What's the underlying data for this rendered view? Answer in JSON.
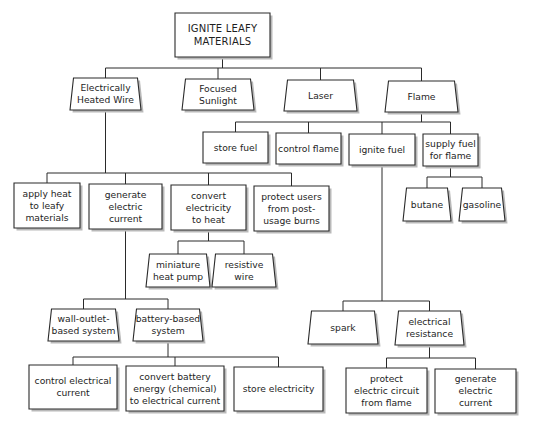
{
  "diagram": {
    "title": "IGNITE LEAFY MATERIALS",
    "nodes": [
      {
        "id": "root",
        "label": "IGNITE LEAFY\nMATERIALS",
        "shape": "rect",
        "x": 175,
        "y": 13,
        "w": 95,
        "h": 44
      },
      {
        "id": "electrically-heated-wire",
        "label": "Electrically\nHeated Wire",
        "shape": "trap",
        "x": 70,
        "y": 78,
        "w": 71,
        "h": 32
      },
      {
        "id": "focused-sunlight",
        "label": "Focused\nSunlight",
        "shape": "trap",
        "x": 182,
        "y": 79,
        "w": 72,
        "h": 31
      },
      {
        "id": "laser",
        "label": "Laser",
        "shape": "trap",
        "x": 284,
        "y": 80,
        "w": 73,
        "h": 31
      },
      {
        "id": "flame",
        "label": "Flame",
        "shape": "trap",
        "x": 385,
        "y": 81,
        "w": 73,
        "h": 31
      },
      {
        "id": "store-fuel",
        "label": "store fuel",
        "shape": "rect",
        "x": 203,
        "y": 132,
        "w": 65,
        "h": 31
      },
      {
        "id": "control-flame",
        "label": "control flame",
        "shape": "rect",
        "x": 276,
        "y": 133,
        "w": 65,
        "h": 31
      },
      {
        "id": "ignite-fuel",
        "label": "ignite fuel",
        "shape": "rect",
        "x": 349,
        "y": 134,
        "w": 66,
        "h": 31
      },
      {
        "id": "supply-fuel",
        "label": "supply fuel\nfor flame",
        "shape": "rect",
        "x": 423,
        "y": 134,
        "w": 55,
        "h": 32
      },
      {
        "id": "apply-heat",
        "label": "apply heat\nto leafy\nmaterials",
        "shape": "rect",
        "x": 14,
        "y": 183,
        "w": 66,
        "h": 45
      },
      {
        "id": "generate-electric-current",
        "label": "generate\nelectric\ncurrent",
        "shape": "rect",
        "x": 89,
        "y": 184,
        "w": 73,
        "h": 45
      },
      {
        "id": "convert-electricity",
        "label": "convert\nelectricity\nto heat",
        "shape": "rect",
        "x": 171,
        "y": 185,
        "w": 75,
        "h": 45
      },
      {
        "id": "protect-users",
        "label": "protect users\nfrom post-\nusage burns",
        "shape": "rect",
        "x": 254,
        "y": 186,
        "w": 75,
        "h": 45
      },
      {
        "id": "butane",
        "label": "butane",
        "shape": "trap",
        "x": 403,
        "y": 188,
        "w": 48,
        "h": 33
      },
      {
        "id": "gasoline",
        "label": "gasoline",
        "shape": "trap",
        "x": 459,
        "y": 188,
        "w": 46,
        "h": 33
      },
      {
        "id": "miniature-heat-pump",
        "label": "miniature\nheat pump",
        "shape": "trap",
        "x": 146,
        "y": 254,
        "w": 64,
        "h": 33
      },
      {
        "id": "resistive-wire",
        "label": "resistive\nwire",
        "shape": "trap",
        "x": 212,
        "y": 254,
        "w": 64,
        "h": 33
      },
      {
        "id": "wall-outlet",
        "label": "wall-outlet-\nbased system",
        "shape": "trap",
        "x": 48,
        "y": 309,
        "w": 71,
        "h": 32
      },
      {
        "id": "battery-based",
        "label": "battery-based\nsystem",
        "shape": "trap",
        "x": 133,
        "y": 309,
        "w": 70,
        "h": 32
      },
      {
        "id": "control-electrical-current",
        "label": "control electrical\ncurrent",
        "shape": "rect",
        "x": 29,
        "y": 365,
        "w": 88,
        "h": 44
      },
      {
        "id": "convert-battery",
        "label": "convert battery\nenergy (chemical)\nto electrical current",
        "shape": "rect",
        "x": 126,
        "y": 366,
        "w": 98,
        "h": 45
      },
      {
        "id": "store-electricity",
        "label": "store electricity",
        "shape": "rect",
        "x": 234,
        "y": 367,
        "w": 89,
        "h": 44
      },
      {
        "id": "spark",
        "label": "spark",
        "shape": "trap",
        "x": 308,
        "y": 311,
        "w": 70,
        "h": 33
      },
      {
        "id": "electrical-resistance",
        "label": "electrical\nresistance",
        "shape": "trap",
        "x": 395,
        "y": 311,
        "w": 69,
        "h": 34
      },
      {
        "id": "protect-electric-circuit",
        "label": "protect\nelectric circuit\nfrom flame",
        "shape": "rect",
        "x": 346,
        "y": 368,
        "w": 81,
        "h": 45
      },
      {
        "id": "generate-electric-current-2",
        "label": "generate\nelectric\ncurrent",
        "shape": "rect",
        "x": 435,
        "y": 369,
        "w": 81,
        "h": 44
      }
    ],
    "edges": [
      {
        "parent": "root",
        "children": [
          "electrically-heated-wire",
          "focused-sunlight",
          "laser",
          "flame"
        ],
        "barY": 68
      },
      {
        "parent": "flame",
        "children": [
          "store-fuel",
          "control-flame",
          "ignite-fuel",
          "supply-fuel"
        ],
        "barY": 122
      },
      {
        "parent": "electrically-heated-wire",
        "children": [
          "apply-heat",
          "generate-electric-current",
          "convert-electricity",
          "protect-users"
        ],
        "barY": 173
      },
      {
        "parent": "supply-fuel",
        "children": [
          "butane",
          "gasoline"
        ],
        "barY": 177
      },
      {
        "parent": "convert-electricity",
        "children": [
          "miniature-heat-pump",
          "resistive-wire"
        ],
        "barY": 241
      },
      {
        "parent": "generate-electric-current",
        "children": [
          "wall-outlet",
          "battery-based"
        ],
        "barY": 299
      },
      {
        "parent": "battery-based",
        "children": [
          "control-electrical-current",
          "convert-battery",
          "store-electricity"
        ],
        "barY": 357
      },
      {
        "parent": "ignite-fuel",
        "children": [
          "spark",
          "electrical-resistance"
        ],
        "barY": 301
      },
      {
        "parent": "electrical-resistance",
        "children": [
          "protect-electric-circuit",
          "generate-electric-current-2"
        ],
        "barY": 358
      }
    ]
  }
}
